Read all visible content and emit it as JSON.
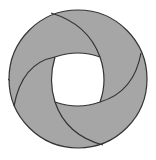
{
  "diagram": {
    "title": "",
    "colors": {
      "background": "#ffffff",
      "fill": "#a6a6a6",
      "stroke": "#333333",
      "hole": "#ffffff"
    },
    "outer_circle": {
      "cx": 78,
      "cy": 79,
      "r": 69
    },
    "inner_hole": {
      "shape": "squircle",
      "path": "M 55 57 Q 78 49 100 57 Q 108 80 100 102 Q 78 110 55 102 Q 48 80 55 57 Z"
    },
    "dividers": [
      {
        "name": "top-divider",
        "path": "M 51 13 Q 88 24 100 57"
      },
      {
        "name": "right-divider",
        "path": "M 141 53 Q 134 92 100 102"
      },
      {
        "name": "bottom-divider",
        "path": "M 103 145 Q 66 135 55 102"
      },
      {
        "name": "left-divider",
        "path": "M 14 106 Q 22 63 55 57"
      }
    ],
    "pieces": 4,
    "tick_mark": {
      "x1": 8,
      "y1": 79,
      "x2": 10,
      "y2": 81
    }
  }
}
